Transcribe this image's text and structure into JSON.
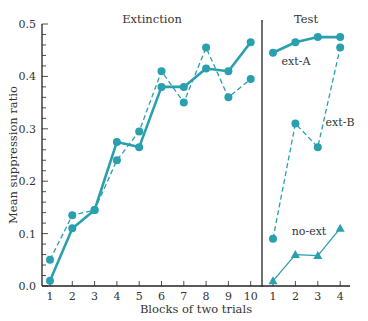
{
  "chart_data": {
    "type": "line",
    "ylabel": "Mean suppression ratio",
    "xlabel": "Blocks of two trials",
    "ylim": [
      0.0,
      0.5
    ],
    "yticks": [
      "0.0",
      "0.1",
      "0.2",
      "0.3",
      "0.4",
      "0.5"
    ],
    "grid": false,
    "color": "#2a9fae",
    "panels": [
      {
        "title": "Extinction",
        "categories": [
          "1",
          "2",
          "3",
          "4",
          "5",
          "6",
          "7",
          "8",
          "9",
          "10"
        ],
        "series": [
          {
            "name": "ext-A",
            "style": "solid",
            "marker": "circle",
            "values": [
              0.01,
              0.11,
              0.145,
              0.275,
              0.265,
              0.38,
              0.38,
              0.415,
              0.41,
              0.465
            ]
          },
          {
            "name": "ext-B",
            "style": "dashed",
            "marker": "circle",
            "values": [
              0.05,
              0.135,
              0.145,
              0.24,
              0.295,
              0.41,
              0.35,
              0.455,
              0.36,
              0.395
            ]
          }
        ]
      },
      {
        "title": "Test",
        "categories": [
          "1",
          "2",
          "3",
          "4"
        ],
        "series": [
          {
            "name": "ext-A",
            "style": "solid",
            "marker": "circle",
            "values": [
              0.445,
              0.465,
              0.475,
              0.475
            ]
          },
          {
            "name": "ext-B",
            "style": "dashed",
            "marker": "circle",
            "values": [
              0.09,
              0.31,
              0.265,
              0.455
            ]
          },
          {
            "name": "no-ext",
            "style": "thin",
            "marker": "triangle",
            "values": [
              0.01,
              0.06,
              0.058,
              0.11
            ]
          }
        ]
      }
    ],
    "annotations": [
      "ext-A",
      "ext-B",
      "no-ext"
    ]
  }
}
